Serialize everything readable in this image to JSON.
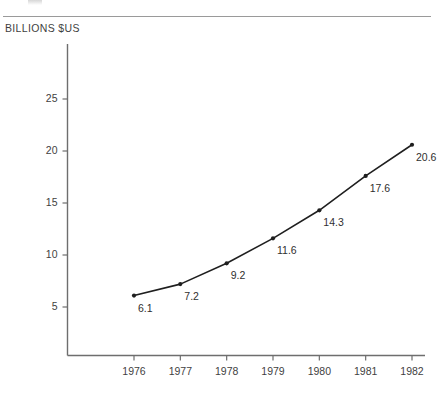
{
  "figure": {
    "unit_label": "BILLIONS $US",
    "axis_color": "#6e6e6e",
    "rule_color": "#9a9a9a",
    "line_color": "#1f1f1f",
    "text_color": "#3f3f3f",
    "background": "#ffffff"
  },
  "chart_data": {
    "type": "line",
    "title": "",
    "subtitle": "",
    "xlabel": "",
    "ylabel": "BILLIONS $US",
    "categories": [
      "1976",
      "1977",
      "1978",
      "1979",
      "1980",
      "1981",
      "1982"
    ],
    "x": [
      1976,
      1977,
      1978,
      1979,
      1980,
      1981,
      1982
    ],
    "values": [
      6.1,
      7.2,
      9.2,
      11.6,
      14.3,
      17.6,
      20.6
    ],
    "point_labels": [
      "6.1",
      "7.2",
      "9.2",
      "11.6",
      "14.3",
      "17.6",
      "20.6"
    ],
    "ytick_labels": [
      "5",
      "10",
      "15",
      "20",
      "25"
    ],
    "yticks": [
      5,
      10,
      15,
      20,
      25
    ],
    "ylim": [
      0,
      27.5
    ],
    "xlim": [
      1975.6,
      1982.4
    ],
    "grid": false,
    "legend": null,
    "markers": true,
    "series": [
      {
        "name": "Billions $US",
        "values": [
          6.1,
          7.2,
          9.2,
          11.6,
          14.3,
          17.6,
          20.6
        ]
      }
    ]
  }
}
